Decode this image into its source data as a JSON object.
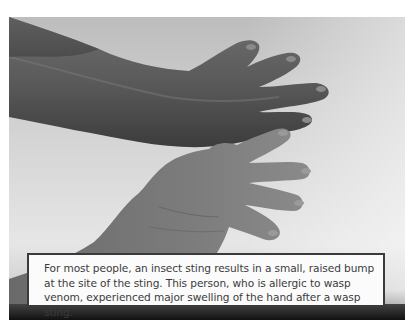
{
  "figure": {
    "image_alt": "Two hands resting on a white surface; the upper hand is markedly swollen after a wasp sting, the lower hand is normal",
    "colors": {
      "background": "#ffffff",
      "caption_border": "#3a3a3a",
      "caption_fill": "#fbfbfb",
      "caption_text": "#3b3b3b"
    },
    "caption": "For most people, an insect sting results in a small, raised bump at the site of the sting. This person, who is allergic to wasp venom, experienced major swelling of the hand after a wasp sting."
  }
}
